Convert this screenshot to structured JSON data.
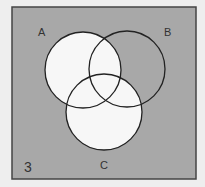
{
  "diagram": {
    "type": "venn",
    "sets": [
      "A",
      "B",
      "C"
    ],
    "labels": {
      "A": "A",
      "B": "B",
      "C": "C"
    },
    "corner_number": "3",
    "shaded_region": "A ∪ C",
    "colors": {
      "background": "#a8a8a8",
      "shaded": "#f7f7f7",
      "outline": "#222222",
      "page": "#eeeeee"
    }
  }
}
